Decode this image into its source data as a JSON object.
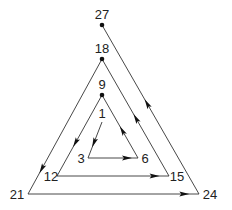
{
  "diagram": {
    "type": "triangular-spiral",
    "colors": {
      "line": "#333333",
      "text": "#222222",
      "dot": "#111111"
    },
    "nodes": [
      {
        "id": "1",
        "label": "1",
        "x": 102,
        "y": 122,
        "dot": false,
        "lx": 102,
        "ly": 118,
        "anchor": "middle"
      },
      {
        "id": "3",
        "label": "3",
        "x": 88,
        "y": 158,
        "dot": false,
        "lx": 81,
        "ly": 163,
        "anchor": "middle"
      },
      {
        "id": "6",
        "label": "6",
        "x": 138,
        "y": 158,
        "dot": false,
        "lx": 145,
        "ly": 163,
        "anchor": "middle"
      },
      {
        "id": "9",
        "label": "9",
        "x": 102,
        "y": 95,
        "dot": true,
        "lx": 102,
        "ly": 89,
        "anchor": "middle"
      },
      {
        "id": "12",
        "label": "12",
        "x": 57,
        "y": 176,
        "dot": false,
        "lx": 51,
        "ly": 181,
        "anchor": "middle"
      },
      {
        "id": "15",
        "label": "15",
        "x": 169,
        "y": 176,
        "dot": false,
        "lx": 177,
        "ly": 181,
        "anchor": "middle"
      },
      {
        "id": "18",
        "label": "18",
        "x": 102,
        "y": 59,
        "dot": true,
        "lx": 102,
        "ly": 53,
        "anchor": "middle"
      },
      {
        "id": "21",
        "label": "21",
        "x": 28,
        "y": 194,
        "dot": false,
        "lx": 17,
        "ly": 199,
        "anchor": "middle"
      },
      {
        "id": "24",
        "label": "24",
        "x": 199,
        "y": 194,
        "dot": false,
        "lx": 210,
        "ly": 199,
        "anchor": "middle"
      },
      {
        "id": "27",
        "label": "27",
        "x": 102,
        "y": 25,
        "dot": true,
        "lx": 102,
        "ly": 19,
        "anchor": "middle"
      }
    ],
    "edges": [
      {
        "from": "1",
        "to": "3",
        "arrow_t": 0.6
      },
      {
        "from": "3",
        "to": "6",
        "arrow_t": 0.8
      },
      {
        "from": "6",
        "to": "9",
        "arrow_t": 0.45
      },
      {
        "from": "9",
        "to": "12",
        "arrow_t": 0.6
      },
      {
        "from": "12",
        "to": "15",
        "arrow_t": 0.88
      },
      {
        "from": "15",
        "to": "18",
        "arrow_t": 0.5
      },
      {
        "from": "18",
        "to": "21",
        "arrow_t": 0.82
      },
      {
        "from": "21",
        "to": "24",
        "arrow_t": 0.92
      },
      {
        "from": "24",
        "to": "27",
        "arrow_t": 0.54
      }
    ]
  }
}
